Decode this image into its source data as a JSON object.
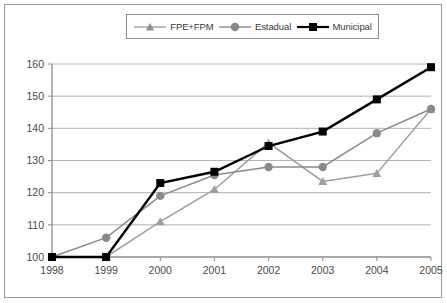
{
  "chart_data": {
    "type": "line",
    "title": "",
    "subtitle": "",
    "xlabel": "",
    "ylabel": "",
    "categories": [
      "1998",
      "1999",
      "2000",
      "2001",
      "2002",
      "2003",
      "2004",
      "2005"
    ],
    "x": [
      1998,
      1999,
      2000,
      2001,
      2002,
      2003,
      2004,
      2005
    ],
    "ylim": [
      100,
      160
    ],
    "yticks": [
      100,
      110,
      120,
      130,
      140,
      150,
      160
    ],
    "xticks": [
      "1998",
      "1999",
      "2000",
      "2001",
      "2002",
      "2003",
      "2004",
      "2005"
    ],
    "grid": true,
    "grid_axis": "y",
    "legend_position": "top-center",
    "series": [
      {
        "name": "FPE+FPM",
        "marker": "triangle",
        "color": "#9e9e9e",
        "values": [
          100,
          100,
          111,
          121,
          135.5,
          123.5,
          126,
          146
        ]
      },
      {
        "name": "Estadual",
        "marker": "circle",
        "color": "#8a8a8a",
        "values": [
          100,
          106,
          119,
          125.5,
          128,
          128,
          138.5,
          146
        ]
      },
      {
        "name": "Municipal",
        "marker": "square",
        "color": "#000000",
        "values": [
          100,
          100,
          123,
          126.5,
          134.5,
          139,
          149,
          159
        ]
      }
    ]
  },
  "legend": {
    "items": [
      {
        "label": "FPE+FPM",
        "marker": "triangle-marker",
        "color": "#9e9e9e"
      },
      {
        "label": "Estadual",
        "marker": "circle-marker",
        "color": "#8a8a8a"
      },
      {
        "label": "Municipal",
        "marker": "square-marker",
        "color": "#000000"
      }
    ]
  },
  "axes": {
    "y_labels": [
      "160",
      "150",
      "140",
      "130",
      "120",
      "110",
      "100"
    ],
    "x_labels": [
      "1998",
      "1999",
      "2000",
      "2001",
      "2002",
      "2003",
      "2004",
      "2005"
    ]
  },
  "colors": {
    "axis": "#8d8d8d",
    "grid": "#b4b4b4",
    "frame": "#9a9a9a",
    "text": "#4a4a4a"
  }
}
